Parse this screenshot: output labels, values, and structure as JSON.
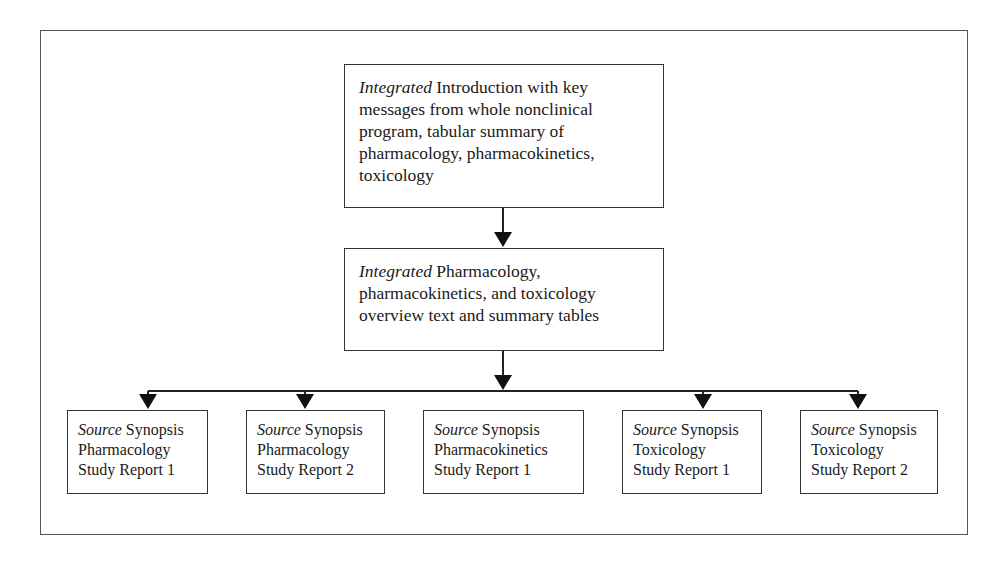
{
  "diagram": {
    "top_box": {
      "emphasis": "Integrated",
      "lines": [
        " Introduction with key",
        "messages from whole nonclinical",
        "program, tabular summary of",
        "pharmacology, pharmacokinetics,",
        "toxicology"
      ]
    },
    "middle_box": {
      "emphasis": "Integrated",
      "lines": [
        " Pharmacology,",
        "pharmacokinetics, and toxicology",
        "overview text and summary tables"
      ]
    },
    "source_boxes": [
      {
        "emphasis": "Source",
        "line1": " Synopsis",
        "line2": "Pharmacology",
        "line3": "Study Report 1"
      },
      {
        "emphasis": "Source",
        "line1": " Synopsis",
        "line2": "Pharmacology",
        "line3": "Study Report 2"
      },
      {
        "emphasis": "Source",
        "line1": " Synopsis",
        "line2": "Pharmacokinetics",
        "line3": "Study Report 1"
      },
      {
        "emphasis": "Source",
        "line1": " Synopsis",
        "line2": "Toxicology",
        "line3": "Study Report 1"
      },
      {
        "emphasis": "Source",
        "line1": " Synopsis",
        "line2": "Toxicology",
        "line3": "Study Report 2"
      }
    ],
    "colors": {
      "stroke": "#222222",
      "background": "#ffffff"
    }
  }
}
